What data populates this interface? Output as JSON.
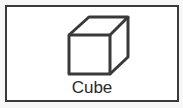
{
  "tile": {
    "label": "Cube",
    "icon": "cube-icon",
    "border_color": "#3a3a3a",
    "icon_color": "#3a3a3a"
  }
}
